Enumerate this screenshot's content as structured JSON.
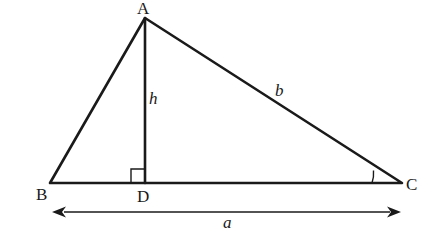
{
  "diagram": {
    "vertices": {
      "A": {
        "label": "A",
        "x": 145,
        "y": 18
      },
      "B": {
        "label": "B",
        "x": 50,
        "y": 183
      },
      "C": {
        "label": "C",
        "x": 402,
        "y": 183
      },
      "D": {
        "label": "D",
        "x": 145,
        "y": 183
      }
    },
    "sides": {
      "b": {
        "label": "b",
        "from": "A",
        "to": "C"
      },
      "h": {
        "label": "h",
        "from": "A",
        "to": "D"
      },
      "a": {
        "label": "a",
        "from": "B",
        "to": "C"
      }
    },
    "markers": {
      "right_angle": "D",
      "angle_arc": "C"
    },
    "stroke_color": "#1a1a1a"
  }
}
